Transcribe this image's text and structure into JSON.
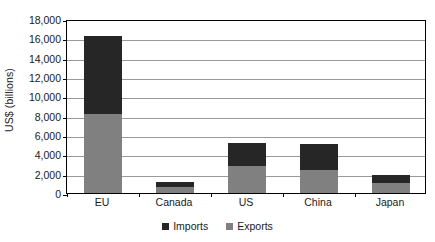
{
  "chart_data": {
    "type": "bar",
    "subtype": "stacked-vertical",
    "title": "",
    "xlabel": "",
    "ylabel": "US$ (billions)",
    "ylim": [
      0,
      18000
    ],
    "ytick_step": 2000,
    "ytick_labels": [
      "0",
      "2,000",
      "4,000",
      "6,000",
      "8,000",
      "10,000",
      "12,000",
      "14,000",
      "16,000",
      "18,000"
    ],
    "ytick_values": [
      0,
      2000,
      4000,
      6000,
      8000,
      10000,
      12000,
      14000,
      16000,
      18000
    ],
    "grid": "horizontal",
    "legend_position": "bottom-center",
    "categories": [
      "EU",
      "Canada",
      "US",
      "China",
      "Japan"
    ],
    "series": [
      {
        "name": "Exports",
        "color": "#808080",
        "values": [
          8200,
          600,
          2800,
          2400,
          1000
        ]
      },
      {
        "name": "Imports",
        "color": "#262626",
        "values": [
          8000,
          550,
          2400,
          2700,
          850
        ]
      }
    ],
    "totals": [
      16200,
      1150,
      5200,
      5100,
      1850
    ]
  },
  "legend": {
    "items": [
      {
        "label": "Imports",
        "color": "#262626"
      },
      {
        "label": "Exports",
        "color": "#808080"
      }
    ]
  },
  "axis": {
    "y_title": "US$ (billions)"
  }
}
